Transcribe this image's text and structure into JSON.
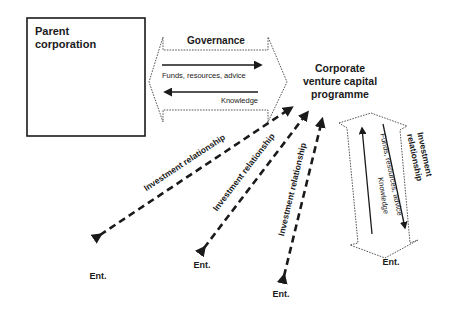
{
  "diagram": {
    "type": "corporate-venture-capital-relationships",
    "nodes": {
      "parent": {
        "label_line1": "Parent",
        "label_line2": "corporation"
      },
      "cvc": {
        "label_line1": "Corporate",
        "label_line2": "venture capital",
        "label_line3": "programme"
      },
      "ventures": [
        {
          "label": "Ent."
        },
        {
          "label": "Ent."
        },
        {
          "label": "Ent."
        },
        {
          "label": "Ent."
        }
      ]
    },
    "governance_block": {
      "title": "Governance",
      "flow_to_cvc": "Funds, resources, advice",
      "flow_to_parent": "Knowledge"
    },
    "investment_edges": [
      {
        "label": "Investment relationship"
      },
      {
        "label": "Investment relationship"
      },
      {
        "label": "Investment relationship"
      }
    ],
    "detail_block": {
      "title_line1": "Investment",
      "title_line2": "relationship",
      "flow_to_venture": "Funds, resources, advice",
      "flow_to_cvc": "Knowledge"
    },
    "colors": {
      "line": "#1a1a1a",
      "dotted": "#444444",
      "background": "#ffffff"
    }
  }
}
